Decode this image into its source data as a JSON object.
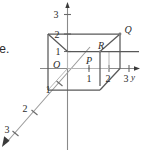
{
  "figure": {
    "kind": "3d-coordinate-box-diagram",
    "cutoff_text": "te.",
    "axes": [
      {
        "name": "x",
        "label": "",
        "direction": "down-left",
        "ticks": [
          "1",
          "2",
          "3"
        ]
      },
      {
        "name": "y",
        "label": "y",
        "direction": "right",
        "ticks": [
          "1",
          "2",
          "3"
        ]
      },
      {
        "name": "z",
        "label": "",
        "direction": "up",
        "ticks": [
          "1",
          "2",
          "3"
        ]
      }
    ],
    "axis_label_y": "y",
    "ticks": {
      "z_3": "3",
      "z_2": "2",
      "z_1": "1",
      "y_1": "1",
      "y_2": "2",
      "y_3": "3",
      "x_1": "1",
      "x_2": "2",
      "x_3": "3"
    },
    "points": {
      "origin": "O",
      "p": "P",
      "r": "R",
      "q": "Q"
    },
    "colors": {
      "ink": "#2b2b2b",
      "edge": "#555555",
      "hidden_edge": "#9a9a9a",
      "axis": "#8a8a8a",
      "background": "#ffffff"
    }
  }
}
